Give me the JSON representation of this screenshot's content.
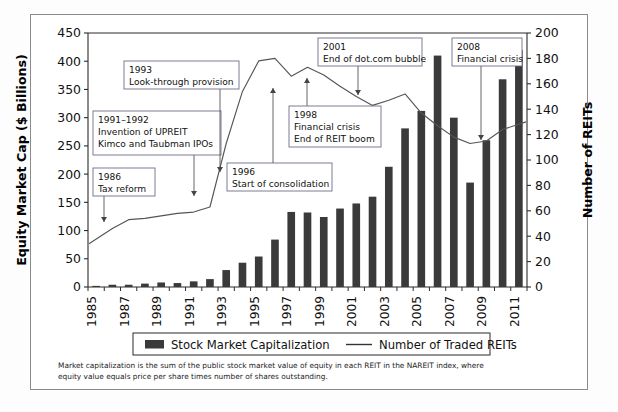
{
  "figure": {
    "background_color": "#ffffff",
    "border_color": "#8b8b8b",
    "bar_color": "#3a3a3a",
    "line_color": "#555555"
  },
  "axes": {
    "y_left_title": "Equity Market Cap ($ Billions)",
    "y_right_title": "Number of REITs",
    "y_left_ticks": [
      "0",
      "50",
      "100",
      "150",
      "200",
      "250",
      "300",
      "350",
      "400",
      "450"
    ],
    "y_right_ticks": [
      "0",
      "20",
      "40",
      "60",
      "80",
      "100",
      "120",
      "140",
      "160",
      "180",
      "200"
    ],
    "x_ticks": [
      "1985",
      "1987",
      "1989",
      "1991",
      "1993",
      "1995",
      "1997",
      "1999",
      "2001",
      "2003",
      "2005",
      "2007",
      "2009",
      "2011"
    ]
  },
  "legend": {
    "bar_label": "Stock Market Capitalization",
    "line_label": "Number of Traded REITs"
  },
  "footnote": {
    "line1": "Market capitalization is the sum of the public stock market value of equity in each REIT in the NAREIT index, where",
    "line2": "equity value equals price per share times number of shares outstanding."
  },
  "annotations": [
    {
      "id": "ann-1986",
      "title": "1986",
      "lines": [
        "Tax reform"
      ],
      "box": {
        "x": 93,
        "y": 168,
        "w": 62,
        "h": 28
      },
      "arrow": {
        "x1": 104,
        "y1": 196,
        "x2": 104,
        "y2": 222
      }
    },
    {
      "id": "ann-1991-1992",
      "title": "1991–1992",
      "lines": [
        "Invention of UPREIT",
        "Kimco and Taubman IPOs"
      ],
      "box": {
        "x": 93,
        "y": 111,
        "w": 128,
        "h": 44
      },
      "arrow": {
        "x1": 194,
        "y1": 155,
        "x2": 194,
        "y2": 196
      }
    },
    {
      "id": "ann-1993",
      "title": "1993",
      "lines": [
        "Look-through provision"
      ],
      "box": {
        "x": 124,
        "y": 61,
        "w": 115,
        "h": 28
      },
      "arrow": {
        "x1": 220,
        "y1": 89,
        "x2": 220,
        "y2": 172
      }
    },
    {
      "id": "ann-1996",
      "title": "1996",
      "lines": [
        "Start of consolidation"
      ],
      "box": {
        "x": 227,
        "y": 163,
        "w": 105,
        "h": 28
      },
      "arrow": {
        "x1": 273,
        "y1": 163,
        "x2": 273,
        "y2": 88
      }
    },
    {
      "id": "ann-1998",
      "title": "1998",
      "lines": [
        "Financial crisis",
        "End of REIT boom"
      ],
      "box": {
        "x": 289,
        "y": 106,
        "w": 92,
        "h": 41
      },
      "arrow": {
        "x1": 307,
        "y1": 106,
        "x2": 307,
        "y2": 78
      }
    },
    {
      "id": "ann-2001",
      "title": "2001",
      "lines": [
        "End of dot.com bubble"
      ],
      "box": {
        "x": 318,
        "y": 38,
        "w": 104,
        "h": 28
      },
      "arrow": {
        "x1": 358,
        "y1": 66,
        "x2": 358,
        "y2": 95
      }
    },
    {
      "id": "ann-2008",
      "title": "2008",
      "lines": [
        "Financial crisis"
      ],
      "box": {
        "x": 452,
        "y": 38,
        "w": 70,
        "h": 28
      },
      "arrow": {
        "x1": 481,
        "y1": 66,
        "x2": 481,
        "y2": 140
      }
    }
  ],
  "chart_data": {
    "type": "bar",
    "title": "",
    "xlabel": "",
    "ylabel": "Equity Market Cap ($ Billions)",
    "y2label": "Number of REITs",
    "ylim": [
      0,
      450
    ],
    "y2lim": [
      0,
      200
    ],
    "grid": false,
    "legend_position": "bottom",
    "categories": [
      "1985",
      "1986",
      "1987",
      "1988",
      "1989",
      "1990",
      "1991",
      "1992",
      "1993",
      "1994",
      "1995",
      "1996",
      "1997",
      "1998",
      "1999",
      "2000",
      "2001",
      "2002",
      "2003",
      "2004",
      "2005",
      "2006",
      "2007",
      "2008",
      "2009",
      "2010",
      "2011"
    ],
    "series": [
      {
        "name": "Stock Market Capitalization",
        "type": "bar",
        "axis": "left",
        "unit": "$ Billions",
        "values": [
          2,
          4,
          4,
          6,
          8,
          7,
          10,
          14,
          30,
          43,
          54,
          84,
          133,
          132,
          124,
          139,
          148,
          160,
          213,
          281,
          312,
          410,
          300,
          185,
          260,
          368,
          420
        ]
      },
      {
        "name": "Number of Traded REITs",
        "type": "line",
        "axis": "right",
        "unit": "count",
        "values": [
          34,
          46,
          53,
          54,
          56,
          58,
          59,
          63,
          113,
          154,
          178,
          180,
          166,
          173,
          167,
          158,
          150,
          143,
          147,
          152,
          137,
          127,
          118,
          113,
          115,
          124,
          130
        ]
      }
    ]
  }
}
